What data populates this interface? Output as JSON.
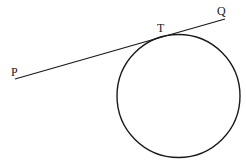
{
  "diagram": {
    "title": "",
    "colors": {
      "stroke": "#1a1a1a",
      "text": "#222222",
      "background": "#ffffff"
    },
    "labels": {
      "P": "P",
      "T": "T",
      "Q": "Q"
    },
    "tangent_line": {
      "from": "P",
      "to": "Q",
      "touches_at": "T"
    },
    "circle": {
      "tangent_point": "T"
    }
  }
}
